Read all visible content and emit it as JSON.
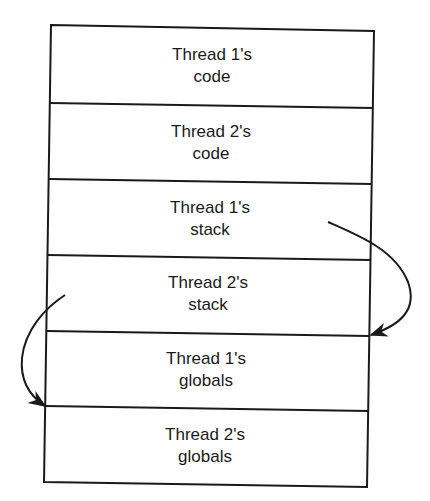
{
  "diagram": {
    "type": "stacked-memory-layout",
    "colors": {
      "background": "#ffffff",
      "stroke": "#1a1a1a",
      "text": "#1a1a1a"
    },
    "cells": [
      {
        "line1": "Thread 1's",
        "line2": "code"
      },
      {
        "line1": "Thread 2's",
        "line2": "code"
      },
      {
        "line1": "Thread 1's",
        "line2": "stack"
      },
      {
        "line1": "Thread 2's",
        "line2": "stack"
      },
      {
        "line1": "Thread 1's",
        "line2": "globals"
      },
      {
        "line1": "Thread 2's",
        "line2": "globals"
      }
    ],
    "arrows": [
      {
        "from": "Thread 1's stack",
        "to": "Thread 1's globals (top edge)",
        "side": "right"
      },
      {
        "from": "Thread 2's stack",
        "to": "Thread 2's globals (top edge)",
        "side": "left"
      }
    ]
  }
}
